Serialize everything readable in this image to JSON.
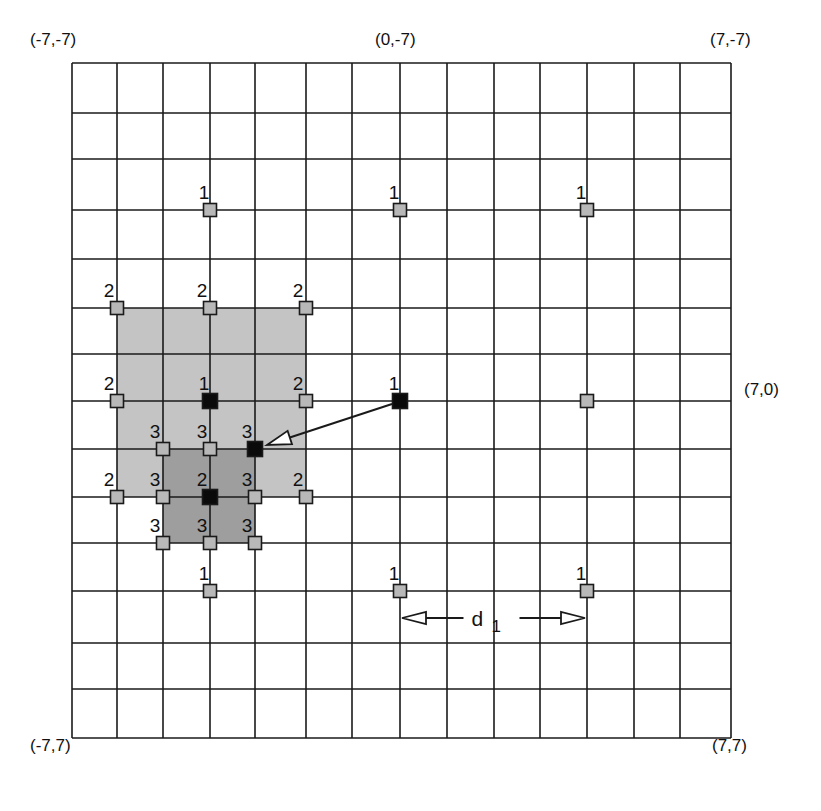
{
  "diagram": {
    "title": "",
    "colors": {
      "grid_line": "#1a1a1a",
      "background": "#ffffff",
      "light_region": "#c4c4c4",
      "dark_region": "#9e9e9e",
      "gray_marker": "#b8b8b8",
      "black_marker": "#0a0a0a",
      "marker_border": "#1a1a1a"
    },
    "grid": {
      "x_range": [
        -7,
        7
      ],
      "y_range": [
        -7,
        7
      ],
      "x_lines_px": [
        72,
        117,
        163,
        210,
        255,
        306,
        352,
        400,
        447,
        494,
        540,
        587,
        634,
        680,
        731
      ],
      "y_lines_px": [
        63,
        113,
        159,
        210,
        259,
        308,
        354,
        401,
        449,
        497,
        543,
        591,
        643,
        689,
        738
      ]
    },
    "corner_labels": [
      {
        "id": "top-left",
        "text": "(-7,-7)",
        "x": 30,
        "y": 44
      },
      {
        "id": "top-center",
        "text": "(0,-7)",
        "x": 375,
        "y": 44
      },
      {
        "id": "top-right",
        "text": "(7,-7)",
        "x": 710,
        "y": 44
      },
      {
        "id": "right-center",
        "text": "(7,0)",
        "x": 744,
        "y": 394
      },
      {
        "id": "bottom-left",
        "text": "(-7,7)",
        "x": 30,
        "y": 750
      },
      {
        "id": "bottom-right",
        "text": "(7,7)",
        "x": 712,
        "y": 750
      }
    ],
    "regions": [
      {
        "id": "light-region",
        "x1": -6,
        "y1": -2,
        "x2": -2,
        "y2": 2,
        "shade": "light"
      },
      {
        "id": "dark-region",
        "x1": -5,
        "y1": 1,
        "x2": -3,
        "y2": 3,
        "shade": "dark"
      }
    ],
    "markers": [
      {
        "x": -4,
        "y": -4,
        "label": "1",
        "type": "gray"
      },
      {
        "x": 0,
        "y": -4,
        "label": "1",
        "type": "gray"
      },
      {
        "x": 4,
        "y": -4,
        "label": "1",
        "type": "gray"
      },
      {
        "x": -4,
        "y": 0,
        "label": "1",
        "type": "black"
      },
      {
        "x": 0,
        "y": 0,
        "label": "1",
        "type": "black"
      },
      {
        "x": 4,
        "y": 0,
        "label": "",
        "type": "gray"
      },
      {
        "x": -4,
        "y": 4,
        "label": "1",
        "type": "gray"
      },
      {
        "x": 0,
        "y": 4,
        "label": "1",
        "type": "gray"
      },
      {
        "x": 4,
        "y": 4,
        "label": "1",
        "type": "gray"
      },
      {
        "x": -6,
        "y": -2,
        "label": "2",
        "type": "gray"
      },
      {
        "x": -4,
        "y": -2,
        "label": "2",
        "type": "gray"
      },
      {
        "x": -2,
        "y": -2,
        "label": "2",
        "type": "gray"
      },
      {
        "x": -6,
        "y": 0,
        "label": "2",
        "type": "gray"
      },
      {
        "x": -2,
        "y": 0,
        "label": "2",
        "type": "gray"
      },
      {
        "x": -6,
        "y": 2,
        "label": "2",
        "type": "gray"
      },
      {
        "x": -4,
        "y": 2,
        "label": "2",
        "type": "black"
      },
      {
        "x": -2,
        "y": 2,
        "label": "2",
        "type": "gray"
      },
      {
        "x": -5,
        "y": 1,
        "label": "3",
        "type": "gray"
      },
      {
        "x": -4,
        "y": 1,
        "label": "3",
        "type": "gray"
      },
      {
        "x": -3,
        "y": 1,
        "label": "3",
        "type": "black"
      },
      {
        "x": -5,
        "y": 2,
        "label": "3",
        "type": "gray"
      },
      {
        "x": -3,
        "y": 2,
        "label": "3",
        "type": "gray"
      },
      {
        "x": -5,
        "y": 3,
        "label": "3",
        "type": "gray"
      },
      {
        "x": -4,
        "y": 3,
        "label": "3",
        "type": "gray"
      },
      {
        "x": -3,
        "y": 3,
        "label": "3",
        "type": "gray"
      }
    ],
    "arrows": [
      {
        "id": "search-step-arrow",
        "from": [
          0,
          0
        ],
        "to": [
          -3,
          1
        ],
        "head": "open-triangle"
      }
    ],
    "dimension": {
      "label": "d",
      "subscript": "1",
      "from": [
        0,
        4
      ],
      "to": [
        4,
        4
      ],
      "offset_y_px": 27
    }
  }
}
